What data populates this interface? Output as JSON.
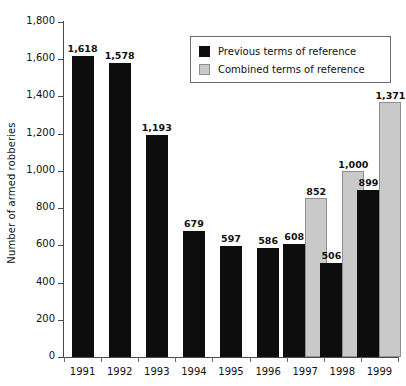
{
  "chart_data": {
    "type": "bar",
    "title": "",
    "xlabel": "",
    "ylabel": "Number of armed robberies",
    "categories": [
      "1991",
      "1992",
      "1993",
      "1994",
      "1995",
      "1996",
      "1997",
      "1998",
      "1999"
    ],
    "series": [
      {
        "name": "Previous terms of reference",
        "color": "#0d0d0d",
        "values": [
          1618,
          1578,
          1193,
          679,
          597,
          586,
          608,
          506,
          899
        ],
        "labels": [
          "1,618",
          "1,578",
          "1,193",
          "679",
          "597",
          "586",
          "608",
          "506",
          "899"
        ]
      },
      {
        "name": "Combined terms of reference",
        "color": "#c9c9c9",
        "values": [
          null,
          null,
          null,
          null,
          null,
          null,
          852,
          1000,
          1371
        ],
        "labels": [
          "",
          "",
          "",
          "",
          "",
          "",
          "852",
          "1,000",
          "1,371"
        ]
      }
    ],
    "ylim": [
      0,
      1800
    ],
    "yticks": [
      0,
      200,
      400,
      600,
      800,
      1000,
      1200,
      1400,
      1600,
      1800
    ],
    "ytick_labels": [
      "0",
      "200",
      "400",
      "600",
      "800",
      "1,000",
      "1,200",
      "1,400",
      "1,600",
      "1,800"
    ],
    "grid": false,
    "legend_position": "top-right"
  },
  "legend": {
    "items": [
      {
        "label": "Previous terms of reference",
        "swatch": "black-square-swatch"
      },
      {
        "label": "Combined terms of reference",
        "swatch": "gray-square-swatch"
      }
    ]
  }
}
